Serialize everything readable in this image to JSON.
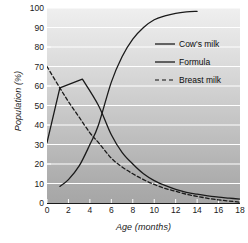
{
  "chart_data": {
    "type": "line",
    "title": "",
    "xlabel": "Age (months)",
    "ylabel": "Population (%)",
    "xlim": [
      0,
      18
    ],
    "ylim": [
      0,
      100
    ],
    "xticks": [
      0,
      2,
      4,
      6,
      8,
      10,
      12,
      14,
      16,
      18
    ],
    "yticks": [
      0,
      10,
      20,
      30,
      40,
      50,
      60,
      70,
      80,
      90,
      100
    ],
    "grid": "horizontal-white-gridlines",
    "legend_position": "upper-right-inside",
    "series": [
      {
        "name": "Cow's milk",
        "style": "solid",
        "color": "#1a1a1a",
        "x": [
          1.2,
          2,
          3,
          4,
          4.8,
          6,
          7,
          8,
          9,
          10,
          11,
          12,
          13,
          14
        ],
        "values": [
          8.5,
          12,
          19,
          30,
          40,
          62,
          75,
          84,
          90,
          94,
          96,
          97.3,
          98,
          98.3
        ]
      },
      {
        "name": "Formula",
        "style": "solid",
        "color": "#1a1a1a",
        "x": [
          0,
          1.2,
          3.3,
          4.8,
          6,
          7,
          8,
          9,
          10,
          11,
          12,
          13,
          14,
          15,
          16,
          17,
          18
        ],
        "values": [
          31,
          59,
          63.5,
          50,
          35,
          26,
          20,
          15,
          11.5,
          9,
          7,
          5.5,
          4.5,
          3.7,
          3,
          2.5,
          2
        ]
      },
      {
        "name": "Breast milk",
        "style": "dashed",
        "color": "#1a1a1a",
        "x": [
          0,
          1.2,
          2,
          3,
          4,
          4.8,
          6,
          7,
          8,
          9,
          10,
          11,
          12,
          13,
          14,
          15,
          16,
          17,
          18
        ],
        "values": [
          70,
          59,
          52,
          44,
          36,
          31,
          23,
          18.5,
          15,
          12,
          9.5,
          7.5,
          6,
          4.5,
          3.4,
          2.4,
          1.6,
          1,
          0.4
        ]
      }
    ]
  },
  "axes": {
    "ylabel": "Population (%)",
    "xlabel": "Age (months)",
    "ytick_labels": [
      "100",
      "90",
      "80",
      "70",
      "60",
      "50",
      "40",
      "30",
      "20",
      "10",
      "0"
    ],
    "xtick_labels": [
      "0",
      "2",
      "4",
      "6",
      "8",
      "10",
      "12",
      "14",
      "16",
      "18"
    ]
  },
  "legend": {
    "items": [
      {
        "label": "Cow's milk",
        "style": "solid"
      },
      {
        "label": "Formula",
        "style": "solid"
      },
      {
        "label": "Breast milk",
        "style": "dashed"
      }
    ]
  },
  "colors": {
    "line": "#1a1a1a",
    "gridline": "#ffffff",
    "plot_bg_top": "#efefef",
    "plot_bg_bottom": "#a6a6a6",
    "text": "#1a1a1a"
  }
}
